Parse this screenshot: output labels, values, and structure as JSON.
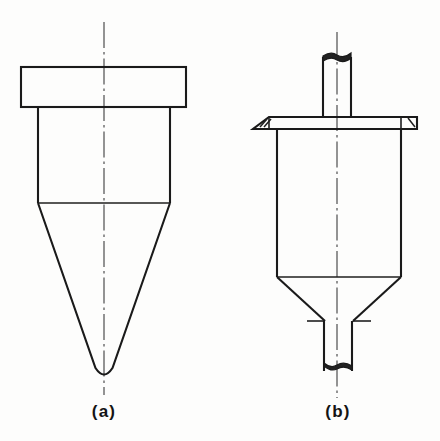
{
  "plate": {
    "kind": "engineering-line-drawing",
    "background_color": "#fdfdfc",
    "line_color": "#1a1a1a",
    "centerline_color": "#555555",
    "width": 440,
    "height": 441
  },
  "figures": [
    {
      "id": "a",
      "caption": "(a)",
      "caption_x": 104,
      "caption_y": 413,
      "description": "conical vessel with wide top flange, cylindrical barrel and long tapered rounded point",
      "centerline": {
        "x": 104,
        "y_top": 22,
        "y_bottom": 395
      },
      "parts": {
        "top_flange": {
          "x_left": 21,
          "x_right": 186,
          "y_top": 67,
          "y_bottom": 107
        },
        "barrel": {
          "x_left": 38,
          "x_right": 170,
          "y_top": 107,
          "y_bottom": 203
        },
        "cone": {
          "x_left": 38,
          "x_right": 170,
          "y_top": 203,
          "tip_x": 104,
          "tip_y": 378,
          "tip_radius": 9
        }
      }
    },
    {
      "id": "b",
      "caption": "(b)",
      "caption_x": 338,
      "caption_y": 413,
      "description": "cylindrical vessel with upper stem tube, flat brim flange with chamfered ends, tapered lower cone and bottom outlet tube",
      "centerline": {
        "x": 337,
        "y_top": 32,
        "y_bottom": 398
      },
      "parts": {
        "top_tube": {
          "x_left": 323,
          "x_right": 351,
          "y_top": 53,
          "y_bottom": 118
        },
        "brim_flange": {
          "x_left": 253,
          "x_right": 417,
          "y_top": 117,
          "y_bottom": 129,
          "bevel": 16
        },
        "barrel": {
          "x_left": 277,
          "x_right": 401,
          "y_top": 129,
          "y_bottom": 277
        },
        "cone": {
          "x_left": 277,
          "x_right": 401,
          "y_top": 277,
          "x_left_bottom": 325,
          "x_right_bottom": 353,
          "y_bottom": 321
        },
        "bottom_tube": {
          "x_left": 324,
          "x_right": 352,
          "y_top": 321,
          "y_bottom": 371
        }
      }
    }
  ],
  "captions": {
    "a": "(a)",
    "b": "(b)"
  }
}
